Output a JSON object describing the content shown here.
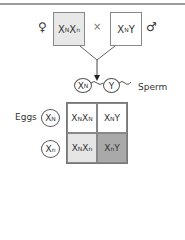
{
  "cross": {
    "female_symbol": "♀",
    "male_symbol": "♂",
    "cross_symbol": "×",
    "female_genotype": {
      "base1": "X",
      "sup1": "N",
      "base2": "X",
      "sup2": "n"
    },
    "male_genotype": {
      "base1": "X",
      "sup1": "N",
      "base2": "Y",
      "sup2": ""
    }
  },
  "sperm": {
    "label": "Sperm",
    "gametes": [
      {
        "base": "X",
        "sup": "N"
      },
      {
        "base": "Y",
        "sup": ""
      }
    ]
  },
  "eggs": {
    "label": "Eggs",
    "gametes": [
      {
        "base": "X",
        "sup": "N"
      },
      {
        "base": "X",
        "sup": "n"
      }
    ]
  },
  "punnett": {
    "cells": [
      {
        "base1": "X",
        "sup1": "N",
        "base2": "X",
        "sup2": "N",
        "fill": "#ffffff"
      },
      {
        "base1": "X",
        "sup1": "N",
        "base2": "Y",
        "sup2": "",
        "fill": "#ffffff"
      },
      {
        "base1": "X",
        "sup1": "N",
        "base2": "X",
        "sup2": "n",
        "fill": "#e6e6e6"
      },
      {
        "base1": "X",
        "sup1": "n",
        "base2": "Y",
        "sup2": "",
        "fill": "#a9a9a9"
      }
    ]
  },
  "colors": {
    "female_box_fill": "#e8e8e8",
    "male_box_fill": "#ffffff",
    "line": "#555555"
  }
}
